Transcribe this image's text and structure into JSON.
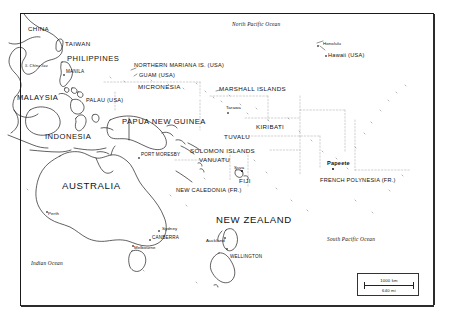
{
  "map": {
    "title": "Oceania and Western Pacific Reference Map",
    "background_color": "#ffffff",
    "line_color": "#111111",
    "frame_color": "#1a1a1a",
    "scale": {
      "distance_km": "1000 km",
      "distance_mi": "640 mi"
    },
    "oceans": [
      {
        "name": "north-pacific-ocean",
        "label": "North Pacific Ocean",
        "x": 232,
        "y": 26
      },
      {
        "name": "south-pacific-ocean",
        "label": "South Pacific Ocean",
        "x": 327,
        "y": 240
      },
      {
        "name": "indian-ocean",
        "label": "Indian Ocean",
        "x": 31,
        "y": 263
      },
      {
        "name": "south-china-sea",
        "label": "S. China Sea",
        "x": 25,
        "y": 66
      }
    ],
    "countries": [
      {
        "name": "china",
        "label": "CHINA",
        "x": 28,
        "y": 29,
        "size": "country"
      },
      {
        "name": "taiwan",
        "label": "TAIWAN",
        "x": 65,
        "y": 44,
        "size": "country"
      },
      {
        "name": "philippines",
        "label": "PHILIPPINES",
        "x": 67,
        "y": 59,
        "size": "country-md"
      },
      {
        "name": "malaysia",
        "label": "MALAYSIA",
        "x": 19,
        "y": 98,
        "size": "country-md"
      },
      {
        "name": "indonesia",
        "label": "INDONESIA",
        "x": 45,
        "y": 136,
        "size": "country-md"
      },
      {
        "name": "papua-new-guinea",
        "label": "PAPUA NEW GUINEA",
        "x": 123,
        "y": 121,
        "size": "country-md"
      },
      {
        "name": "australia",
        "label": "AUSTRALIA",
        "x": 63,
        "y": 186,
        "size": "country-lg"
      },
      {
        "name": "new-zealand",
        "label": "NEW ZEALAND",
        "x": 218,
        "y": 220,
        "size": "country-lg"
      },
      {
        "name": "micronesia",
        "label": "MICRONESIA",
        "x": 138,
        "y": 86,
        "size": "country"
      },
      {
        "name": "marshall-islands",
        "label": "MARSHALL ISLANDS",
        "x": 219,
        "y": 89,
        "size": "country"
      },
      {
        "name": "kiribati",
        "label": "KIRIBATI",
        "x": 256,
        "y": 126,
        "size": "country"
      },
      {
        "name": "tuvalu",
        "label": "TUVALU",
        "x": 224,
        "y": 137,
        "size": "country"
      },
      {
        "name": "solomon-islands",
        "label": "SOLOMON ISLANDS",
        "x": 192,
        "y": 150,
        "size": "country"
      },
      {
        "name": "vanuatu",
        "label": "VANUATU",
        "x": 200,
        "y": 160,
        "size": "country"
      },
      {
        "name": "fiji",
        "label": "FIJI",
        "x": 239,
        "y": 179,
        "size": "country"
      }
    ],
    "territories": [
      {
        "name": "northern-mariana-is-usa",
        "label": "NORTHERN MARIANA IS. (USA)",
        "x": 134,
        "y": 65
      },
      {
        "name": "guam-usa",
        "label": "GUAM (USA)",
        "x": 139,
        "y": 76
      },
      {
        "name": "palau-usa",
        "label": "PALAU (USA)",
        "x": 86,
        "y": 100
      },
      {
        "name": "hawaii-usa",
        "label": "Hawaii (USA)",
        "x": 328,
        "y": 55
      },
      {
        "name": "new-caledonia-fr",
        "label": "NEW CALEDONIA (FR.)",
        "x": 177,
        "y": 190
      },
      {
        "name": "french-polynesia-fr",
        "label": "FRENCH POLYNESIA (FR.)",
        "x": 320,
        "y": 180
      }
    ],
    "capitals": [
      {
        "name": "manila",
        "label": "MANILA",
        "x": 66,
        "y": 71
      },
      {
        "name": "port-moresby",
        "label": "PORT MORESBY",
        "x": 141,
        "y": 154
      },
      {
        "name": "canberra",
        "label": "CANBERRA",
        "x": 152,
        "y": 238
      },
      {
        "name": "wellington",
        "label": "WELLINGTON",
        "x": 230,
        "y": 257
      }
    ],
    "cities": [
      {
        "name": "honolulu",
        "label": "Honolulu",
        "x": 323,
        "y": 44
      },
      {
        "name": "tarawa",
        "label": "Tarawa",
        "x": 226,
        "y": 108
      },
      {
        "name": "suva",
        "label": "Suva",
        "x": 234,
        "y": 167
      },
      {
        "name": "papeete",
        "label": "Papeete",
        "x": 328,
        "y": 163,
        "bold": true
      },
      {
        "name": "perth",
        "label": "Perth",
        "x": 48,
        "y": 213
      },
      {
        "name": "sydney",
        "label": "Sydney",
        "x": 162,
        "y": 228
      },
      {
        "name": "melbourne",
        "label": "Melbourne",
        "x": 135,
        "y": 247
      },
      {
        "name": "auckland",
        "label": "Auckland",
        "x": 207,
        "y": 240
      }
    ]
  }
}
